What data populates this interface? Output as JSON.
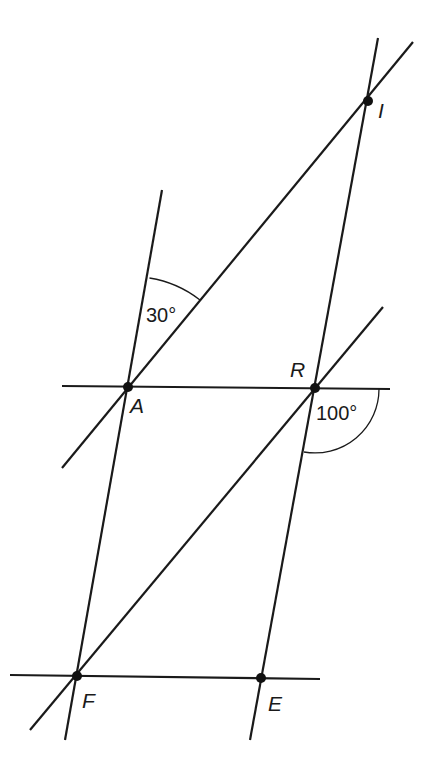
{
  "diagram": {
    "type": "geometry-figure",
    "points": [
      {
        "name": "I",
        "x": 368,
        "y": 101
      },
      {
        "name": "A",
        "x": 128,
        "y": 387
      },
      {
        "name": "R",
        "x": 315,
        "y": 388
      },
      {
        "name": "F",
        "x": 77,
        "y": 676
      },
      {
        "name": "E",
        "x": 261,
        "y": 678
      }
    ],
    "labels": {
      "I": "I",
      "A": "A",
      "R": "R",
      "F": "F",
      "E": "E"
    },
    "angles": {
      "angle_at_A": "30°",
      "angle_at_R": "100°"
    },
    "lines": [
      {
        "name": "line-AI",
        "through": [
          "A",
          "I"
        ]
      },
      {
        "name": "line-IRE",
        "through": [
          "I",
          "R",
          "E"
        ]
      },
      {
        "name": "line-AF",
        "through": [
          "A",
          "F"
        ]
      },
      {
        "name": "line-FR",
        "through": [
          "F",
          "R"
        ]
      },
      {
        "name": "line-AR",
        "through": [
          "A",
          "R"
        ]
      },
      {
        "name": "line-FE",
        "through": [
          "F",
          "E"
        ]
      }
    ],
    "colors": {
      "stroke": "#1a1a1a",
      "background": "#ffffff"
    }
  }
}
